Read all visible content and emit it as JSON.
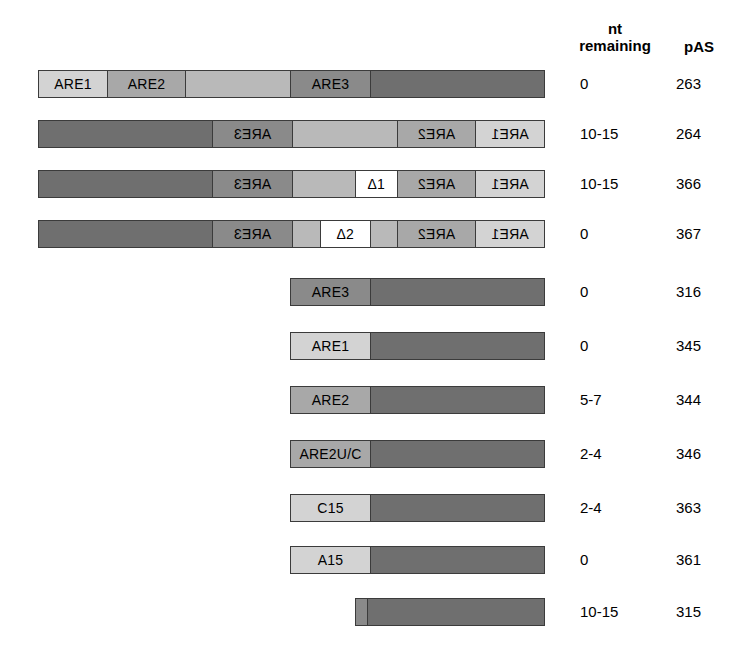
{
  "headers": {
    "nt_line1": "nt",
    "nt_line2": "remaining",
    "pas": "pAS"
  },
  "chart_data": {
    "type": "diagram",
    "title": "",
    "columns": [
      "construct",
      "nt remaining",
      "pAS"
    ],
    "bar_axis": {
      "left_px": 38,
      "right_px": 545
    },
    "rows": [
      {
        "id": "pAS263",
        "orientation": "forward",
        "nt_remaining": "0",
        "pas": "263",
        "left": 38,
        "right": 545,
        "segments": [
          {
            "label": "ARE1",
            "tone": "tone-light",
            "start": 38,
            "end": 107
          },
          {
            "label": "ARE2",
            "tone": "tone-mid",
            "start": 107,
            "end": 185
          },
          {
            "label": "",
            "tone": "tone-midl",
            "start": 185,
            "end": 290
          },
          {
            "label": "ARE3",
            "tone": "tone-dark",
            "start": 290,
            "end": 370
          },
          {
            "label": "",
            "tone": "tone-darker",
            "start": 370,
            "end": 545
          }
        ]
      },
      {
        "id": "pAS264",
        "orientation": "reversed",
        "nt_remaining": "10-15",
        "pas": "264",
        "left": 38,
        "right": 545,
        "segments": [
          {
            "label": "ARE1",
            "tone": "tone-light",
            "start": 38,
            "end": 107
          },
          {
            "label": "ARE2",
            "tone": "tone-mid",
            "start": 107,
            "end": 185
          },
          {
            "label": "",
            "tone": "tone-midl",
            "start": 185,
            "end": 290
          },
          {
            "label": "ARE3",
            "tone": "tone-dark",
            "start": 290,
            "end": 370
          },
          {
            "label": "",
            "tone": "tone-darker",
            "start": 370,
            "end": 545
          }
        ]
      },
      {
        "id": "pAS366",
        "orientation": "reversed",
        "nt_remaining": "10-15",
        "pas": "366",
        "left": 38,
        "right": 545,
        "segments": [
          {
            "label": "ARE1",
            "tone": "tone-light",
            "start": 38,
            "end": 107
          },
          {
            "label": "ARE2",
            "tone": "tone-mid",
            "start": 107,
            "end": 185
          },
          {
            "label": "Δ1",
            "tone": "tone-white",
            "start": 185,
            "end": 227
          },
          {
            "label": "",
            "tone": "tone-midl",
            "start": 227,
            "end": 290
          },
          {
            "label": "ARE3",
            "tone": "tone-dark",
            "start": 290,
            "end": 370
          },
          {
            "label": "",
            "tone": "tone-darker",
            "start": 370,
            "end": 545
          }
        ]
      },
      {
        "id": "pAS367",
        "orientation": "reversed",
        "nt_remaining": "0",
        "pas": "367",
        "left": 38,
        "right": 545,
        "segments": [
          {
            "label": "ARE1",
            "tone": "tone-light",
            "start": 38,
            "end": 107
          },
          {
            "label": "ARE2",
            "tone": "tone-mid",
            "start": 107,
            "end": 185
          },
          {
            "label": "",
            "tone": "tone-midl",
            "start": 185,
            "end": 212
          },
          {
            "label": "Δ2",
            "tone": "tone-white",
            "start": 212,
            "end": 262
          },
          {
            "label": "",
            "tone": "tone-midl",
            "start": 262,
            "end": 290
          },
          {
            "label": "ARE3",
            "tone": "tone-dark",
            "start": 290,
            "end": 370
          },
          {
            "label": "",
            "tone": "tone-darker",
            "start": 370,
            "end": 545
          }
        ]
      },
      {
        "id": "pAS316",
        "orientation": "forward",
        "nt_remaining": "0",
        "pas": "316",
        "left": 290,
        "right": 545,
        "segments": [
          {
            "label": "ARE3",
            "tone": "tone-dark",
            "start": 290,
            "end": 370
          },
          {
            "label": "",
            "tone": "tone-darker",
            "start": 370,
            "end": 545
          }
        ]
      },
      {
        "id": "pAS345",
        "orientation": "forward",
        "nt_remaining": "0",
        "pas": "345",
        "left": 290,
        "right": 545,
        "segments": [
          {
            "label": "ARE1",
            "tone": "tone-light",
            "start": 290,
            "end": 370
          },
          {
            "label": "",
            "tone": "tone-darker",
            "start": 370,
            "end": 545
          }
        ]
      },
      {
        "id": "pAS344",
        "orientation": "forward",
        "nt_remaining": "5-7",
        "pas": "344",
        "left": 290,
        "right": 545,
        "segments": [
          {
            "label": "ARE2",
            "tone": "tone-mid",
            "start": 290,
            "end": 370
          },
          {
            "label": "",
            "tone": "tone-darker",
            "start": 370,
            "end": 545
          }
        ]
      },
      {
        "id": "pAS346",
        "orientation": "forward",
        "nt_remaining": "2-4",
        "pas": "346",
        "left": 290,
        "right": 545,
        "segments": [
          {
            "label": "ARE2U/C",
            "tone": "tone-mid",
            "start": 290,
            "end": 370
          },
          {
            "label": "",
            "tone": "tone-darker",
            "start": 370,
            "end": 545
          }
        ]
      },
      {
        "id": "pAS363",
        "orientation": "forward",
        "nt_remaining": "2-4",
        "pas": "363",
        "left": 290,
        "right": 545,
        "segments": [
          {
            "label": "C15",
            "tone": "tone-light",
            "start": 290,
            "end": 370
          },
          {
            "label": "",
            "tone": "tone-darker",
            "start": 370,
            "end": 545
          }
        ]
      },
      {
        "id": "pAS361",
        "orientation": "forward",
        "nt_remaining": "0",
        "pas": "361",
        "left": 290,
        "right": 545,
        "segments": [
          {
            "label": "A15",
            "tone": "tone-light",
            "start": 290,
            "end": 370
          },
          {
            "label": "",
            "tone": "tone-darker",
            "start": 370,
            "end": 545
          }
        ]
      },
      {
        "id": "pAS315",
        "orientation": "forward",
        "nt_remaining": "10-15",
        "pas": "315",
        "left": 355,
        "right": 545,
        "segments": [
          {
            "label": "",
            "tone": "tone-dark",
            "start": 355,
            "end": 367
          },
          {
            "label": "",
            "tone": "tone-darker",
            "start": 367,
            "end": 545
          }
        ]
      }
    ],
    "row_tops": [
      70,
      120,
      170,
      220,
      278,
      332,
      386,
      440,
      494,
      546,
      598
    ]
  }
}
